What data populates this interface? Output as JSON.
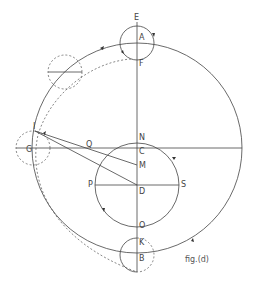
{
  "figure": {
    "caption": "fig.(d)",
    "labels": {
      "E": "E",
      "A": "A",
      "F": "F",
      "N": "N",
      "C": "C",
      "M": "M",
      "D": "D",
      "P": "P",
      "S": "S",
      "O": "O",
      "K": "K",
      "B": "B",
      "Q": "Q",
      "G": "G",
      "I": "I"
    },
    "colors": {
      "stroke": "#444444",
      "background": "#ffffff"
    }
  }
}
